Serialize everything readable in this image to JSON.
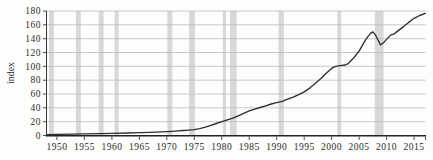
{
  "chart_data": {
    "type": "line",
    "title": "",
    "xlabel": "",
    "ylabel": "index",
    "xlim": [
      1948.1,
      2017.1
    ],
    "ylim": [
      0,
      180
    ],
    "x_ticks": [
      1950,
      1955,
      1960,
      1965,
      1970,
      1975,
      1980,
      1985,
      1990,
      1995,
      2000,
      2005,
      2010,
      2015
    ],
    "y_ticks": [
      0,
      20,
      40,
      60,
      80,
      100,
      120,
      140,
      160,
      180
    ],
    "grid": "horizontal",
    "legend": "none",
    "series": [
      {
        "name": "index",
        "x": [
          1948.1,
          1950,
          1953,
          1955,
          1958,
          1960,
          1963,
          1965,
          1967,
          1969,
          1970,
          1971,
          1972,
          1973,
          1974,
          1975,
          1976,
          1977,
          1978,
          1979,
          1980,
          1981,
          1982,
          1983,
          1984,
          1985,
          1986,
          1987,
          1988,
          1989,
          1990,
          1991,
          1992,
          1993,
          1994,
          1995,
          1996,
          1997,
          1998,
          1999,
          2000,
          2000.7,
          2001.5,
          2002.5,
          2003,
          2004,
          2005,
          2006,
          2006.6,
          2007.1,
          2007.5,
          2008,
          2008.9,
          2009.3,
          2010,
          2010.8,
          2011.3,
          2012,
          2013,
          2014,
          2015,
          2016,
          2017.05
        ],
        "y": [
          1.3,
          1.6,
          2.0,
          2.4,
          2.8,
          3.1,
          3.6,
          4.0,
          4.6,
          5.2,
          5.6,
          6.0,
          6.6,
          7.3,
          7.8,
          8.4,
          10.0,
          12.0,
          14.8,
          17.4,
          20.0,
          22.5,
          25.0,
          28.5,
          32.0,
          35.5,
          38.0,
          40.5,
          43.0,
          45.5,
          47.5,
          49.5,
          52.5,
          55.5,
          59.0,
          63.0,
          68.5,
          75.0,
          82.0,
          90.0,
          97.0,
          100.0,
          101.0,
          102.0,
          104.0,
          112.0,
          122.0,
          136.0,
          143.0,
          148.0,
          150.0,
          145.0,
          131.0,
          133.0,
          139.0,
          145.5,
          146.5,
          151.0,
          157.0,
          163.5,
          169.5,
          173.5,
          176.5
        ]
      }
    ],
    "recession_bands": [
      [
        1948.55,
        1949.45
      ],
      [
        1953.45,
        1954.35
      ],
      [
        1957.6,
        1958.5
      ],
      [
        1960.5,
        1961.25
      ],
      [
        1970.1,
        1971.0
      ],
      [
        1974.05,
        1975.1
      ],
      [
        1980.2,
        1980.75
      ],
      [
        1981.5,
        1982.7
      ],
      [
        1990.35,
        1991.3
      ],
      [
        2001.05,
        2001.75
      ],
      [
        2007.85,
        2009.45
      ]
    ],
    "colors": {
      "line": "#2e2e2e",
      "band": "#d8d8d8",
      "grid": "#bdbdbd",
      "axis": "#3a3a3a",
      "text": "#2b2b2b",
      "background": "#fdfdfb"
    }
  }
}
